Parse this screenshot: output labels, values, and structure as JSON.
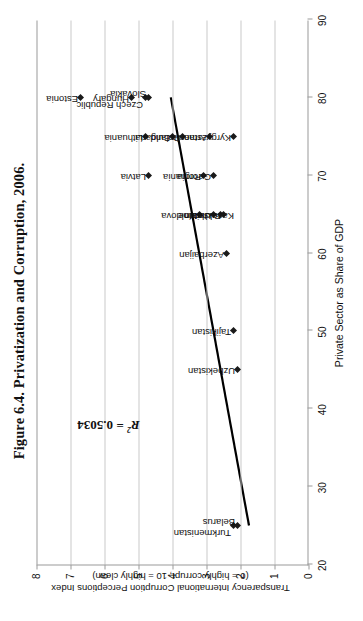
{
  "figure": {
    "title": "Figure 6.4. Privatization and Corruption, 2006.",
    "annotation_r2_symbol": "R",
    "annotation_r2_exponent": "2",
    "annotation_r2_value": " = 0.5034",
    "rotation_degrees": "-90"
  },
  "chart_data": {
    "type": "scatter",
    "title": "Figure 6.4. Privatization and Corruption, 2006.",
    "xlabel": "Private Sector as Share of GDP",
    "ylabel": "Transparency International Corruption Perceptions Index",
    "ylabel_line2": "(0 = highly corrupt, 10 = highly clean)",
    "xlim": [
      20,
      90
    ],
    "ylim": [
      0,
      8
    ],
    "xticks": [
      20,
      30,
      40,
      50,
      60,
      70,
      80,
      90
    ],
    "yticks": [
      0,
      1,
      2,
      3,
      4,
      5,
      6,
      7,
      8
    ],
    "grid": "horizontal-only",
    "legend": "none",
    "r_squared": 0.5034,
    "annotation": "R² = 0.5034",
    "points": [
      {
        "label": "Estonia",
        "x": 80,
        "y": 6.7,
        "lx": 8,
        "ly": -2
      },
      {
        "label": "Hungary",
        "x": 80,
        "y": 5.2,
        "lx": 8,
        "ly": -2
      },
      {
        "label": "Czech Republic",
        "x": 80,
        "y": 4.8,
        "lx": 8,
        "ly": -8
      },
      {
        "label": "Slovakia",
        "x": 80,
        "y": 4.7,
        "lx": 8,
        "ly": 3
      },
      {
        "label": "Latvia",
        "x": 70,
        "y": 4.7,
        "lx": 8,
        "ly": -2
      },
      {
        "label": "Lithuania",
        "x": 75,
        "y": 4.8,
        "lx": 8,
        "ly": -2
      },
      {
        "label": "Bulgaria",
        "x": 75,
        "y": 4.0,
        "lx": 8,
        "ly": -2
      },
      {
        "label": "Poland",
        "x": 75,
        "y": 3.7,
        "lx": 8,
        "ly": -2
      },
      {
        "label": "Romania",
        "x": 70,
        "y": 3.1,
        "lx": 8,
        "ly": -2
      },
      {
        "label": "Armenia",
        "x": 75,
        "y": 2.9,
        "lx": 8,
        "ly": -2
      },
      {
        "label": "Georgia",
        "x": 70,
        "y": 2.8,
        "lx": 8,
        "ly": -2
      },
      {
        "label": "Moldova",
        "x": 65,
        "y": 3.2,
        "lx": 8,
        "ly": -2
      },
      {
        "label": "Ukraine",
        "x": 65,
        "y": 2.8,
        "lx": 8,
        "ly": -2
      },
      {
        "label": "Russia",
        "x": 65,
        "y": 2.5,
        "lx": 8,
        "ly": -2
      },
      {
        "label": "Kazakhstan",
        "x": 65,
        "y": 2.6,
        "lx": -8,
        "ly": -2
      },
      {
        "label": "Kyrgyzstan",
        "x": 75,
        "y": 2.2,
        "lx": 8,
        "ly": -2
      },
      {
        "label": "Azerbaijan",
        "x": 60,
        "y": 2.4,
        "lx": 8,
        "ly": -2
      },
      {
        "label": "Tajikistan",
        "x": 50,
        "y": 2.2,
        "lx": 8,
        "ly": -2
      },
      {
        "label": "Uzbekistan",
        "x": 45,
        "y": 2.1,
        "lx": 8,
        "ly": -2
      },
      {
        "label": "Turkmenistan",
        "x": 25,
        "y": 2.2,
        "lx": 8,
        "ly": -8
      },
      {
        "label": "Belarus",
        "x": 25,
        "y": 2.1,
        "lx": 8,
        "ly": 3
      }
    ],
    "trendline": {
      "x0": 25,
      "y0": 1.75,
      "x1": 80,
      "y1": 4.05
    }
  },
  "colors": {
    "marker": "#1a1a1a",
    "trendline": "#000000",
    "gridline": "#c9c9c9",
    "axis": "#9a9a9a",
    "text": "#111111",
    "background": "#ffffff"
  }
}
